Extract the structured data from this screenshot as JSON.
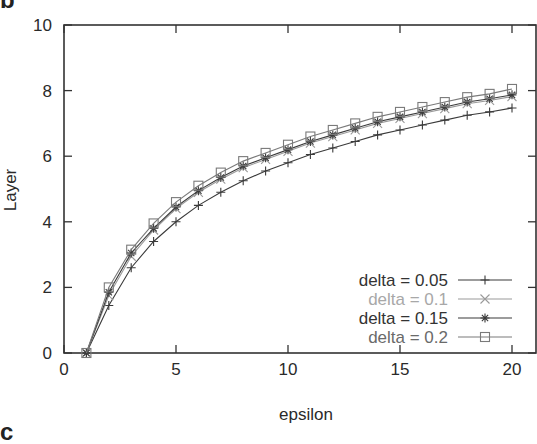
{
  "panel": {
    "label": "b",
    "next_label": "c"
  },
  "chart_data": {
    "type": "line",
    "title": "",
    "xlabel": "epsilon",
    "ylabel": "Layer",
    "xlim": [
      0,
      20.8
    ],
    "ylim": [
      0,
      10
    ],
    "xticks": [
      0,
      5,
      10,
      15,
      20
    ],
    "yticks": [
      0,
      2,
      4,
      6,
      8,
      10
    ],
    "grid": false,
    "legend_position": "lower right",
    "x": [
      1,
      2,
      3,
      4,
      5,
      6,
      7,
      8,
      9,
      10,
      11,
      12,
      13,
      14,
      15,
      16,
      17,
      18,
      19,
      20
    ],
    "series": [
      {
        "name": "delta = 0.05",
        "marker": "plus",
        "color": "#3a3a3a",
        "values": [
          0,
          1.45,
          2.6,
          3.4,
          4.0,
          4.5,
          4.9,
          5.25,
          5.55,
          5.8,
          6.05,
          6.25,
          6.45,
          6.65,
          6.8,
          6.95,
          7.1,
          7.25,
          7.35,
          7.47
        ]
      },
      {
        "name": "delta = 0.1",
        "marker": "x",
        "color": "#9a9a9a",
        "values": [
          0,
          1.75,
          2.95,
          3.75,
          4.4,
          4.9,
          5.3,
          5.65,
          5.9,
          6.15,
          6.4,
          6.6,
          6.8,
          7.0,
          7.15,
          7.3,
          7.45,
          7.6,
          7.7,
          7.82
        ]
      },
      {
        "name": "delta = 0.15",
        "marker": "star",
        "color": "#3a3a3a",
        "values": [
          0,
          1.85,
          3.05,
          3.8,
          4.45,
          4.95,
          5.35,
          5.7,
          5.95,
          6.2,
          6.45,
          6.65,
          6.85,
          7.05,
          7.2,
          7.35,
          7.5,
          7.65,
          7.75,
          7.87
        ]
      },
      {
        "name": "delta = 0.2",
        "marker": "square",
        "color": "#7a7a7a",
        "values": [
          0,
          2.0,
          3.15,
          3.95,
          4.6,
          5.1,
          5.5,
          5.85,
          6.1,
          6.35,
          6.6,
          6.8,
          7.0,
          7.2,
          7.35,
          7.5,
          7.65,
          7.8,
          7.9,
          8.05
        ]
      }
    ]
  }
}
